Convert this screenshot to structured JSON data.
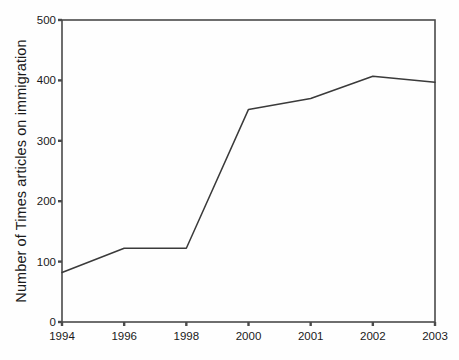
{
  "chart_data": {
    "type": "line",
    "title": "",
    "xlabel": "",
    "ylabel": "Number of Times articles on immigration",
    "categories": [
      "1994",
      "1996",
      "1998",
      "2000",
      "2001",
      "2002",
      "2003"
    ],
    "values": [
      82,
      122,
      122,
      352,
      370,
      407,
      397
    ],
    "series": [
      {
        "name": "Number of Times articles on immigration",
        "values": [
          82,
          122,
          122,
          352,
          370,
          407,
          397
        ]
      }
    ],
    "ylim": [
      0,
      500
    ],
    "yticks": [
      0,
      100,
      200,
      300,
      400,
      500
    ],
    "ytick_labels": [
      "0",
      "100",
      "200",
      "300",
      "400",
      "500"
    ],
    "xtick_labels": [
      "1994",
      "1996",
      "1998",
      "2000",
      "2001",
      "2002",
      "2003"
    ],
    "grid": false,
    "legend": false,
    "legend_position": "none",
    "line_color": "#3a3a3a",
    "axis_color": "#4a4a4a",
    "background_color": "#fefefe",
    "markers": false
  },
  "caption": ""
}
